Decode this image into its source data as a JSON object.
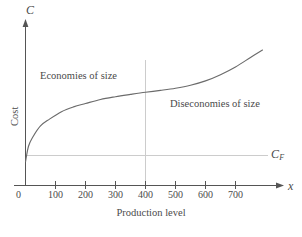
{
  "chart_data": {
    "type": "line",
    "title": "",
    "xlabel": "Production level",
    "ylabel": "Cost",
    "x_axis_symbol": "x",
    "y_axis_symbol": "C",
    "xlim": [
      0,
      790
    ],
    "ylim": [
      0,
      1
    ],
    "grid": "single vertical gridline at x=400; single horizontal gridline at y=C_F",
    "xticks": [
      0,
      100,
      200,
      300,
      400,
      500,
      600,
      700
    ],
    "xtick_labels": [
      "0",
      "100",
      "200",
      "300",
      "400",
      "500",
      "600",
      "700"
    ],
    "yticks": [],
    "ytick_labels": [],
    "legend": "none",
    "series": [
      {
        "name": "Total cost curve",
        "color": "#6b6b6b",
        "x": [
          0,
          10,
          25,
          50,
          80,
          120,
          160,
          200,
          250,
          300,
          350,
          400,
          450,
          500,
          550,
          600,
          650,
          700,
          750,
          790
        ],
        "y": [
          0.175,
          0.29,
          0.36,
          0.44,
          0.49,
          0.545,
          0.58,
          0.605,
          0.635,
          0.655,
          0.672,
          0.688,
          0.702,
          0.718,
          0.74,
          0.772,
          0.818,
          0.875,
          0.945,
          1.0
        ]
      }
    ],
    "reference_lines": [
      {
        "name": "fixed-cost-line",
        "orientation": "horizontal",
        "label": "C_F",
        "value": 0.175,
        "color": "#cccccc"
      },
      {
        "name": "inflection-gridline",
        "orientation": "vertical",
        "label": "400",
        "value": 400,
        "color": "#cccccc"
      }
    ],
    "annotations": [
      {
        "name": "economies-of-size",
        "text": "Economies of size",
        "x": 110,
        "y": 0.78
      },
      {
        "name": "diseconomies-of-size",
        "text": "Diseconomies of size",
        "x": 540,
        "y": 0.6
      }
    ],
    "cf_label": "C",
    "cf_subscript": "F"
  },
  "axes": {
    "y_symbol": "C",
    "x_symbol": "x",
    "x_title": "Production level",
    "y_title": "Cost"
  },
  "ticks": {
    "x": [
      "0",
      "100",
      "200",
      "300",
      "400",
      "500",
      "600",
      "700"
    ]
  },
  "annotations": {
    "economies": "Economies of size",
    "diseconomies": "Diseconomies of size"
  },
  "colors": {
    "curve": "#6b6b6b",
    "axis": "#555555",
    "gridline": "#cccccc",
    "text": "#4a4a4a"
  }
}
